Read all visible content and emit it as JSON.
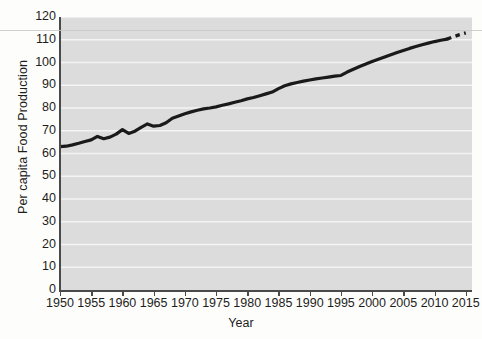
{
  "chart_data": {
    "type": "line",
    "title": "",
    "xlabel": "Year",
    "ylabel": "Per capita Food Production",
    "xlim": [
      1950,
      2016
    ],
    "ylim": [
      0,
      120
    ],
    "ytick_step": 10,
    "xtick_step": 5,
    "grid": "horizontal",
    "legend": "none",
    "plot_background": "#dcdcdc",
    "line_color": "#1a1a1a",
    "ytick_labels": [
      "120",
      "110",
      "100",
      "90",
      "80",
      "70",
      "60",
      "50",
      "40",
      "30",
      "20",
      "10",
      "0"
    ],
    "ytick_values": [
      120,
      110,
      100,
      90,
      80,
      70,
      60,
      50,
      40,
      30,
      20,
      10,
      0
    ],
    "xtick_labels": [
      "1950",
      "1955",
      "1960",
      "1965",
      "1970",
      "1975",
      "1980",
      "1985",
      "1990",
      "1995",
      "2000",
      "2005",
      "2010",
      "2015"
    ],
    "xtick_values": [
      1950,
      1955,
      1960,
      1965,
      1970,
      1975,
      1980,
      1985,
      1990,
      1995,
      2000,
      2005,
      2010,
      2015
    ],
    "series": [
      {
        "name": "Per capita Food Production (observed)",
        "style": "solid",
        "x": [
          1950,
          1951,
          1952,
          1953,
          1954,
          1955,
          1956,
          1957,
          1958,
          1959,
          1960,
          1961,
          1962,
          1963,
          1964,
          1965,
          1966,
          1967,
          1968,
          1969,
          1970,
          1971,
          1972,
          1973,
          1974,
          1975,
          1976,
          1977,
          1978,
          1979,
          1980,
          1981,
          1982,
          1983,
          1984,
          1985,
          1986,
          1987,
          1988,
          1989,
          1990,
          1991,
          1992,
          1993,
          1994,
          1995,
          1996,
          1997,
          1998,
          1999,
          2000,
          2001,
          2002,
          2003,
          2004,
          2005,
          2006,
          2007,
          2008,
          2009,
          2010,
          2011,
          2012
        ],
        "y": [
          63,
          63.2,
          63.8,
          64.5,
          65.3,
          66,
          67.5,
          66.5,
          67.2,
          68.5,
          70.5,
          68.8,
          69.8,
          71.5,
          73,
          72,
          72.3,
          73.5,
          75.5,
          76.5,
          77.5,
          78.3,
          79,
          79.6,
          80,
          80.5,
          81.2,
          81.8,
          82.5,
          83.2,
          84,
          84.6,
          85.4,
          86.2,
          87,
          88.5,
          89.8,
          90.6,
          91.2,
          91.8,
          92.3,
          92.8,
          93.2,
          93.6,
          94,
          94.3,
          95.8,
          97,
          98.2,
          99.3,
          100.4,
          101.4,
          102.4,
          103.4,
          104.4,
          105.3,
          106.2,
          107,
          107.8,
          108.5,
          109.2,
          109.8,
          110.3
        ]
      },
      {
        "name": "Projection",
        "style": "dashed",
        "x": [
          2012,
          2013,
          2014,
          2015
        ],
        "y": [
          110.3,
          111.3,
          112.2,
          113
        ]
      }
    ]
  }
}
